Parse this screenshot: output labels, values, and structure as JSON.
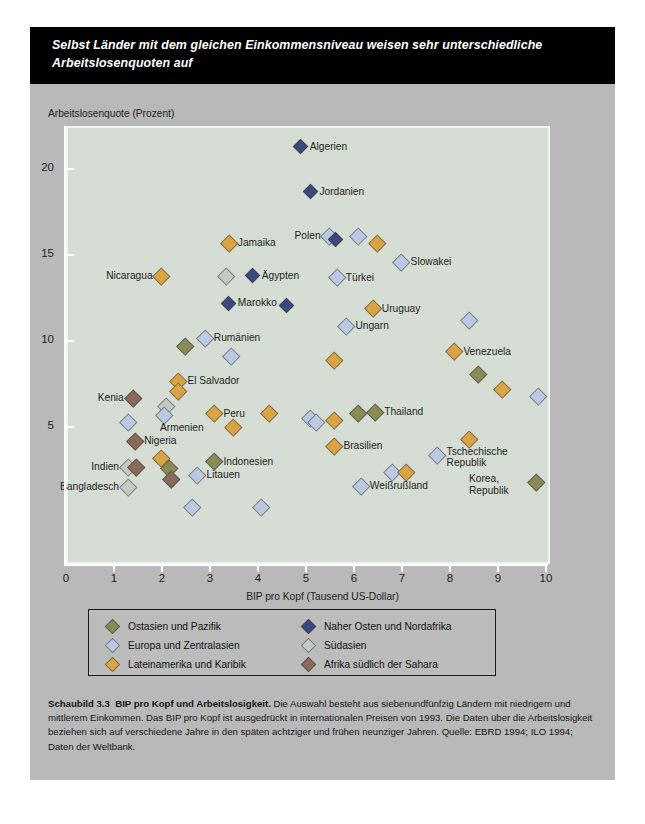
{
  "banner": {
    "line1": "Selbst Länder mit dem gleichen Einkommensniveau weisen sehr unterschiedliche",
    "line2": "Arbeitslosenquoten auf"
  },
  "axes": {
    "ylabel": "Arbeitslosenquote (Prozent)",
    "xlabel": "BIP pro Kopf (Tausend US-Dollar)",
    "yticks": [
      "5",
      "10",
      "15",
      "20"
    ],
    "xticks": [
      "0",
      "1",
      "2",
      "3",
      "4",
      "5",
      "6",
      "7",
      "8",
      "9",
      "10"
    ]
  },
  "legend": {
    "items": [
      {
        "label": "Ostasien und Pazifik",
        "color": "#8a8a58"
      },
      {
        "label": "Europa und Zentralasien",
        "color": "#bcc9e2"
      },
      {
        "label": "Lateinamerika und Karibik",
        "color": "#d8a445"
      },
      {
        "label": "Naher Osten und Nordafrika",
        "color": "#3b4a7c"
      },
      {
        "label": "Südasien",
        "color": "#c3cbc4"
      },
      {
        "label": "Afrika südlich der Sahara",
        "color": "#8a6a5b"
      }
    ]
  },
  "caption": {
    "figure": "Schaubild 3.3",
    "title": "BIP pro Kopf und Arbeitslosigkeit.",
    "body": "Die Auswahl besteht aus siebenundfünfzig Ländern mit niedrigem und mittlerem Einkommen. Das BIP pro Kopf ist ausgedrückt in internationalen Preisen von 1993. Die Daten über die Arbeitslosigkeit beziehen sich auf verschiedene Jahre in den späten achtziger und frühen neunziger Jahren.",
    "source": "Quelle: EBRD 1994; ILO 1994; Daten der Weltbank."
  },
  "colors": {
    "east_asia_pacific": "#8a8a58",
    "europe_central_asia": "#bcc9e2",
    "latin_america_caribbean": "#d8a445",
    "middle_east_north_africa": "#3b4a7c",
    "south_asia": "#c3cbc4",
    "africa_sub_sahara": "#8a6a5b",
    "plot_background": "#d6ddd4",
    "card_background": "#b9b9b9",
    "banner_background": "#000000"
  },
  "chart_data": {
    "type": "scatter",
    "title": "Selbst Länder mit dem gleichen Einkommensniveau weisen sehr unterschiedliche Arbeitslosenquoten auf",
    "xlabel": "BIP pro Kopf (Tausend US-Dollar)",
    "ylabel": "Arbeitslosenquote (Prozent)",
    "xlim": [
      0,
      10
    ],
    "ylim": [
      0,
      22.8
    ],
    "grid": false,
    "legend_position": "below-plot",
    "series": [
      {
        "name": "Ostasien und Pazifik",
        "key": "east_asia_pacific",
        "color": "#8a8a58"
      },
      {
        "name": "Europa und Zentralasien",
        "key": "europe_central_asia",
        "color": "#bcc9e2"
      },
      {
        "name": "Lateinamerika und Karibik",
        "key": "latin_america_caribbean",
        "color": "#d8a445"
      },
      {
        "name": "Naher Osten und Nordafrika",
        "key": "middle_east_north_africa",
        "color": "#3b4a7c"
      },
      {
        "name": "Südasien",
        "key": "south_asia",
        "color": "#c3cbc4"
      },
      {
        "name": "Afrika südlich der Sahara",
        "key": "africa_sub_sahara",
        "color": "#8a6a5b"
      }
    ],
    "points": [
      {
        "label": "Algerien",
        "x": 4.85,
        "y": 21.4,
        "group": "middle_east_north_africa",
        "lpos": "r"
      },
      {
        "label": "Jordanien",
        "x": 5.05,
        "y": 18.8,
        "group": "middle_east_north_africa",
        "lpos": "r"
      },
      {
        "label": "Jamaika",
        "x": 3.35,
        "y": 15.8,
        "group": "latin_america_caribbean",
        "lpos": "r"
      },
      {
        "label": "Polen",
        "x": 5.45,
        "y": 16.2,
        "group": "europe_central_asia",
        "lpos": "l"
      },
      {
        "label": "",
        "x": 5.58,
        "y": 16.0,
        "group": "middle_east_north_africa",
        "lpos": ""
      },
      {
        "label": "",
        "x": 6.05,
        "y": 16.2,
        "group": "europe_central_asia",
        "lpos": ""
      },
      {
        "label": "",
        "x": 6.45,
        "y": 15.8,
        "group": "latin_america_caribbean",
        "lpos": ""
      },
      {
        "label": "Nicaragua",
        "x": 1.95,
        "y": 13.9,
        "group": "latin_america_caribbean",
        "lpos": "l"
      },
      {
        "label": "",
        "x": 3.3,
        "y": 13.9,
        "group": "south_asia",
        "lpos": ""
      },
      {
        "label": "Ägypten",
        "x": 3.85,
        "y": 13.9,
        "group": "middle_east_north_africa",
        "lpos": "r"
      },
      {
        "label": "Slowakei",
        "x": 6.95,
        "y": 14.7,
        "group": "europe_central_asia",
        "lpos": "r"
      },
      {
        "label": "Türkei",
        "x": 5.6,
        "y": 13.8,
        "group": "europe_central_asia",
        "lpos": "r"
      },
      {
        "label": "Marokko",
        "x": 3.35,
        "y": 12.3,
        "group": "middle_east_north_africa",
        "lpos": "r"
      },
      {
        "label": "",
        "x": 4.55,
        "y": 12.2,
        "group": "middle_east_north_africa",
        "lpos": ""
      },
      {
        "label": "Uruguay",
        "x": 6.35,
        "y": 12.0,
        "group": "latin_america_caribbean",
        "lpos": "r"
      },
      {
        "label": "Ungarn",
        "x": 5.8,
        "y": 11.0,
        "group": "europe_central_asia",
        "lpos": "r"
      },
      {
        "label": "",
        "x": 8.35,
        "y": 11.3,
        "group": "europe_central_asia",
        "lpos": ""
      },
      {
        "label": "Rumänien",
        "x": 2.85,
        "y": 10.3,
        "group": "europe_central_asia",
        "lpos": "r"
      },
      {
        "label": "",
        "x": 2.45,
        "y": 9.8,
        "group": "east_asia_pacific",
        "lpos": ""
      },
      {
        "label": "",
        "x": 3.4,
        "y": 9.25,
        "group": "europe_central_asia",
        "lpos": ""
      },
      {
        "label": "",
        "x": 5.55,
        "y": 9.0,
        "group": "latin_america_caribbean",
        "lpos": ""
      },
      {
        "label": "Venezuela",
        "x": 8.05,
        "y": 9.5,
        "group": "latin_america_caribbean",
        "lpos": "r"
      },
      {
        "label": "",
        "x": 8.55,
        "y": 8.2,
        "group": "east_asia_pacific",
        "lpos": ""
      },
      {
        "label": "",
        "x": 9.05,
        "y": 7.3,
        "group": "latin_america_caribbean",
        "lpos": ""
      },
      {
        "label": "",
        "x": 9.8,
        "y": 6.9,
        "group": "europe_central_asia",
        "lpos": ""
      },
      {
        "label": "El Salvador",
        "x": 2.3,
        "y": 7.8,
        "group": "latin_america_caribbean",
        "lpos": "r"
      },
      {
        "label": "",
        "x": 2.3,
        "y": 7.2,
        "group": "latin_america_caribbean",
        "lpos": ""
      },
      {
        "label": "Kenia",
        "x": 1.35,
        "y": 6.8,
        "group": "africa_sub_sahara",
        "lpos": "l"
      },
      {
        "label": "",
        "x": 2.05,
        "y": 6.3,
        "group": "south_asia",
        "lpos": ""
      },
      {
        "label": "Armenien",
        "x": 2.0,
        "y": 5.8,
        "group": "europe_central_asia",
        "lpos": "b"
      },
      {
        "label": "",
        "x": 1.25,
        "y": 5.4,
        "group": "europe_central_asia",
        "lpos": ""
      },
      {
        "label": "Peru",
        "x": 3.05,
        "y": 5.9,
        "group": "latin_america_caribbean",
        "lpos": "r"
      },
      {
        "label": "",
        "x": 3.45,
        "y": 5.1,
        "group": "latin_america_caribbean",
        "lpos": ""
      },
      {
        "label": "",
        "x": 4.2,
        "y": 5.9,
        "group": "latin_america_caribbean",
        "lpos": ""
      },
      {
        "label": "",
        "x": 5.05,
        "y": 5.6,
        "group": "europe_central_asia",
        "lpos": ""
      },
      {
        "label": "",
        "x": 5.18,
        "y": 5.4,
        "group": "europe_central_asia",
        "lpos": ""
      },
      {
        "label": "",
        "x": 5.55,
        "y": 5.5,
        "group": "latin_america_caribbean",
        "lpos": ""
      },
      {
        "label": "",
        "x": 6.05,
        "y": 5.9,
        "group": "east_asia_pacific",
        "lpos": ""
      },
      {
        "label": "Thailand",
        "x": 6.4,
        "y": 6.0,
        "group": "east_asia_pacific",
        "lpos": "r"
      },
      {
        "label": "Nigeria",
        "x": 1.4,
        "y": 4.3,
        "group": "africa_sub_sahara",
        "lpos": "r"
      },
      {
        "label": "Brasilien",
        "x": 5.55,
        "y": 4.0,
        "group": "latin_america_caribbean",
        "lpos": "r"
      },
      {
        "label": "",
        "x": 8.35,
        "y": 4.4,
        "group": "latin_america_caribbean",
        "lpos": ""
      },
      {
        "label": "",
        "x": 1.95,
        "y": 3.3,
        "group": "latin_america_caribbean",
        "lpos": ""
      },
      {
        "label": "Indonesien",
        "x": 3.05,
        "y": 3.1,
        "group": "east_asia_pacific",
        "lpos": "r"
      },
      {
        "label": "Indien",
        "x": 1.25,
        "y": 2.8,
        "group": "south_asia",
        "lpos": "l"
      },
      {
        "label": "",
        "x": 1.42,
        "y": 2.8,
        "group": "africa_sub_sahara",
        "lpos": ""
      },
      {
        "label": "",
        "x": 2.1,
        "y": 2.7,
        "group": "east_asia_pacific",
        "lpos": ""
      },
      {
        "label": "Tschechische Republik",
        "x": 7.7,
        "y": 3.5,
        "group": "europe_central_asia",
        "lpos": "r2"
      },
      {
        "label": "",
        "x": 2.15,
        "y": 2.1,
        "group": "africa_sub_sahara",
        "lpos": ""
      },
      {
        "label": "Litauen",
        "x": 2.7,
        "y": 2.3,
        "group": "europe_central_asia",
        "lpos": "r"
      },
      {
        "label": "",
        "x": 6.75,
        "y": 2.5,
        "group": "europe_central_asia",
        "lpos": ""
      },
      {
        "label": "",
        "x": 7.05,
        "y": 2.5,
        "group": "latin_america_caribbean",
        "lpos": ""
      },
      {
        "label": "Bangladesch",
        "x": 1.25,
        "y": 1.6,
        "group": "south_asia",
        "lpos": "l"
      },
      {
        "label": "Weißrußland",
        "x": 6.1,
        "y": 1.7,
        "group": "europe_central_asia",
        "lpos": "r"
      },
      {
        "label": "Korea, Republik",
        "x": 9.75,
        "y": 1.9,
        "group": "east_asia_pacific",
        "lpos": "l2"
      },
      {
        "label": "",
        "x": 2.58,
        "y": 0.45,
        "group": "europe_central_asia",
        "lpos": ""
      },
      {
        "label": "",
        "x": 4.02,
        "y": 0.45,
        "group": "europe_central_asia",
        "lpos": ""
      }
    ]
  }
}
